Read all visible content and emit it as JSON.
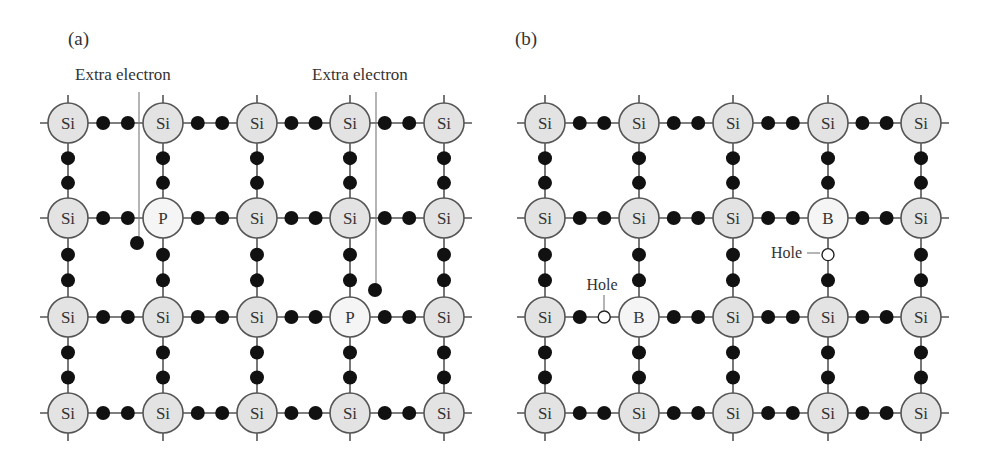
{
  "diagram": {
    "colors": {
      "bond": "#555555",
      "electron": "#111111",
      "atom_stroke": "#555555",
      "si_fill": "#e3e3e3",
      "dopant_fill": "#f5f5f5",
      "hole_fill": "#ffffff",
      "text": "#333333"
    },
    "atom_radius": 20,
    "panels": [
      {
        "id": "a",
        "label": "(a)",
        "label_pos": [
          68,
          45
        ],
        "columns": [
          68,
          163,
          257,
          350,
          444
        ],
        "rows": [
          123,
          218,
          317,
          413
        ],
        "atoms": [
          [
            "Si",
            "Si",
            "Si",
            "Si",
            "Si"
          ],
          [
            "Si",
            "P",
            "Si",
            "Si",
            "Si"
          ],
          [
            "Si",
            "Si",
            "Si",
            "P",
            "Si"
          ],
          [
            "Si",
            "Si",
            "Si",
            "Si",
            "Si"
          ]
        ],
        "holes": [],
        "annotations": [
          {
            "text": "Extra electron",
            "text_x": 75,
            "text_y": 80,
            "anchor": "start",
            "line": [
              139,
              92,
              139,
              240
            ],
            "electron": [
              137,
              243
            ]
          },
          {
            "text": "Extra electron",
            "text_x": 312,
            "text_y": 80,
            "anchor": "start",
            "line": [
              376,
              92,
              376,
              285
            ],
            "electron": [
              375,
              290
            ]
          }
        ]
      },
      {
        "id": "b",
        "label": "(b)",
        "label_pos": [
          515,
          45
        ],
        "columns": [
          545,
          639,
          733,
          828,
          921
        ],
        "rows": [
          123,
          218,
          317,
          413
        ],
        "atoms": [
          [
            "Si",
            "Si",
            "Si",
            "Si",
            "Si"
          ],
          [
            "Si",
            "Si",
            "Si",
            "B",
            "Si"
          ],
          [
            "Si",
            "B",
            "Si",
            "Si",
            "Si"
          ],
          [
            "Si",
            "Si",
            "Si",
            "Si",
            "Si"
          ]
        ],
        "holes": [
          {
            "bond": "v",
            "row": 1,
            "col": 3,
            "slot": 0,
            "pos": [
              828,
              253
            ]
          },
          {
            "bond": "h",
            "row": 2,
            "col": 0,
            "slot": 1,
            "pos": [
              605,
              317
            ]
          }
        ],
        "annotations": [
          {
            "text": "Hole",
            "text_x": 802,
            "text_y": 258,
            "anchor": "end",
            "line": [
              807,
              253,
              820,
              253
            ]
          },
          {
            "text": "Hole",
            "text_x": 602,
            "text_y": 290,
            "anchor": "middle",
            "line": [
              604,
              295,
              604,
              310
            ]
          }
        ]
      }
    ]
  }
}
